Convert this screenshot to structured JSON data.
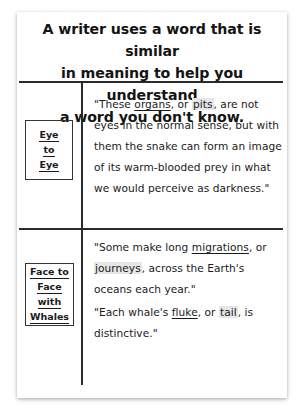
{
  "title": "A writer uses a word that is similar in meaning to help you understand a word you don't know.",
  "title_lines": [
    "A writer uses a word that is similar",
    "in meaning to help you understand",
    "a word you don't know."
  ],
  "rows": [
    {
      "source_title_lines": [
        "Eye",
        "to",
        "Eye"
      ],
      "quotes": [
        {
          "before": "\"These ",
          "unknown_word": "organs",
          "middle": ", or ",
          "synonym": "pits",
          "after": ", are not eyes in the normal sense, but with them the snake can form an image of its warm-blooded prey in what we would perceive as darkness.\""
        }
      ]
    },
    {
      "source_title_lines": [
        "Face to",
        "Face",
        "with",
        "Whales"
      ],
      "quotes": [
        {
          "before": "\"Some make long ",
          "unknown_word": "migrations",
          "middle": ", or ",
          "synonym": "journeys",
          "after": ", across the Earth's oceans each year.\""
        },
        {
          "before": "\"Each whale's ",
          "unknown_word": "fluke",
          "middle": ", or ",
          "synonym": "tail",
          "after": ", is distinctive.\""
        }
      ]
    }
  ],
  "colors": {
    "text": "#1a1a1a",
    "rule": "#2a2a2a",
    "highlight": "#e6e6e6",
    "background": "#ffffff"
  }
}
